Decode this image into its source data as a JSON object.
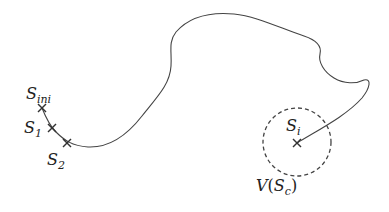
{
  "diagram": {
    "type": "trajectory",
    "colors": {
      "stroke": "#444444",
      "background": "#ffffff",
      "text": "#222222"
    },
    "points": [
      {
        "id": "S_ini",
        "base": "S",
        "sub": "ini",
        "x": 42,
        "y": 108
      },
      {
        "id": "S_1",
        "base": "S",
        "sub": "1",
        "x": 52,
        "y": 128
      },
      {
        "id": "S_2",
        "base": "S",
        "sub": "2",
        "x": 67,
        "y": 143
      },
      {
        "id": "S_i",
        "base": "S",
        "sub": "i",
        "x": 297,
        "y": 143
      }
    ],
    "neighborhood": {
      "label_base": "V",
      "label_open": "(",
      "label_inner_base": "S",
      "label_inner_sub": "c",
      "label_close": ")",
      "cx": 297,
      "cy": 142,
      "r": 34,
      "style": "dashed"
    }
  }
}
